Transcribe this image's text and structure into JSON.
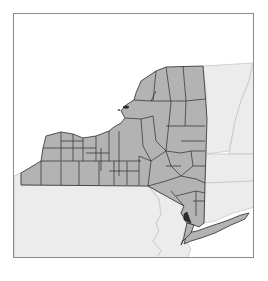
{
  "map": {
    "subject": "New York State counties",
    "highlighted_region": "Rockland County",
    "colors": {
      "state_fill": "#b3b3b3",
      "county_border": "#2b2b2b",
      "neighbor_fill": "#ececec",
      "neighbor_border": "#c4c4c4",
      "water": "#ffffff",
      "highlight_fill": "#2e2e2e",
      "frame_border": "#8a8a8a"
    }
  }
}
